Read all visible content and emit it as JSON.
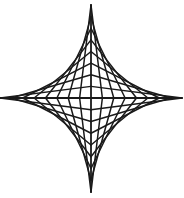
{
  "figure": {
    "type": "string-art-astroid",
    "background_color": "#ffffff",
    "line_color": "#1a1a1a",
    "center": {
      "x": 91,
      "y": 98
    },
    "arm_lengths": {
      "up": 93,
      "down": 94,
      "left": 91,
      "right": 91
    },
    "lines_per_quadrant": 7,
    "axis_stroke_width": 1.8,
    "line_stroke_width": 1.5,
    "quadrants": [
      "upper-right",
      "upper-left",
      "lower-left",
      "lower-right"
    ]
  }
}
